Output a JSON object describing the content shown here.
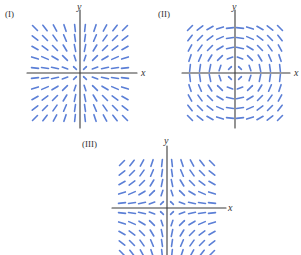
{
  "figure": {
    "panels": [
      {
        "id": "I",
        "label": "(I)",
        "x_axis_label": "x",
        "y_axis_label": "y",
        "slope_field": "y/x",
        "origin": [
          80,
          73
        ],
        "label_pos": [
          5,
          9
        ],
        "ylabel_pos": [
          77,
          2
        ],
        "xlabel_pos": [
          141,
          68
        ],
        "axis_h": [
          27,
          137
        ],
        "axis_v": [
          10,
          128
        ]
      },
      {
        "id": "II",
        "label": "(II)",
        "x_axis_label": "x",
        "y_axis_label": "y",
        "slope_field": "-x/y",
        "origin": [
          235,
          73
        ],
        "label_pos": [
          158,
          9
        ],
        "ylabel_pos": [
          232,
          2
        ],
        "xlabel_pos": [
          295,
          68
        ],
        "axis_h": [
          182,
          290
        ],
        "axis_v": [
          10,
          128
        ]
      },
      {
        "id": "III",
        "label": "(III)",
        "x_axis_label": "x",
        "y_axis_label": "y",
        "slope_field": "-y/x",
        "origin": [
          167,
          208
        ],
        "label_pos": [
          82,
          137
        ],
        "ylabel_pos": [
          165,
          137
        ],
        "xlabel_pos": [
          229,
          202
        ],
        "axis_h": [
          112,
          226
        ],
        "axis_v": [
          146,
          255
        ]
      }
    ],
    "style": {
      "segment_color": "#5b7fd6",
      "axis_color": "#3a3a3a",
      "grid_spacing": 10,
      "grid_count": 5,
      "segment_length": 7
    }
  }
}
